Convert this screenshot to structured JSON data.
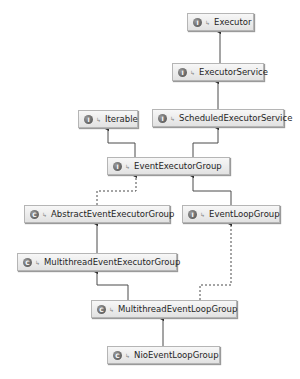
{
  "diagram": {
    "type": "class-hierarchy",
    "nodes": [
      {
        "id": "executor",
        "label": "Executor",
        "kind": "I",
        "x": 187,
        "y": 13,
        "w": 67
      },
      {
        "id": "executor-service",
        "label": "ExecutorService",
        "kind": "I",
        "x": 172,
        "y": 63,
        "w": 92
      },
      {
        "id": "iterable",
        "label": "Iterable",
        "kind": "I",
        "x": 78,
        "y": 110,
        "w": 60
      },
      {
        "id": "scheduled-executor-service",
        "label": "ScheduledExecutorService",
        "kind": "I",
        "x": 152,
        "y": 109,
        "w": 132
      },
      {
        "id": "event-executor-group",
        "label": "EventExecutorGroup",
        "kind": "I",
        "x": 107,
        "y": 157,
        "w": 123
      },
      {
        "id": "abstract-event-executor-group",
        "label": "AbstractEventExecutorGroup",
        "kind": "C",
        "x": 24,
        "y": 205,
        "w": 146
      },
      {
        "id": "event-loop-group",
        "label": "EventLoopGroup",
        "kind": "I",
        "x": 182,
        "y": 205,
        "w": 98
      },
      {
        "id": "multithread-event-executor-group",
        "label": "MultithreadEventExecutorGroup",
        "kind": "C",
        "x": 17,
        "y": 253,
        "w": 160
      },
      {
        "id": "multithread-event-loop-group",
        "label": "MultithreadEventLoopGroup",
        "kind": "C",
        "x": 91,
        "y": 300,
        "w": 146
      },
      {
        "id": "nio-event-loop-group",
        "label": "NioEventLoopGroup",
        "kind": "C",
        "x": 107,
        "y": 346,
        "w": 113
      }
    ],
    "edges": [
      {
        "from": "executor-service",
        "to": "executor",
        "style": "solid",
        "points": "220,63 220,31"
      },
      {
        "from": "scheduled-executor-service",
        "to": "executor-service",
        "style": "solid",
        "points": "218,109 218,81"
      },
      {
        "from": "event-executor-group",
        "to": "iterable",
        "style": "solid",
        "points": "135,157 135,143 108,143 108,128"
      },
      {
        "from": "event-executor-group",
        "to": "scheduled-executor-service",
        "style": "solid",
        "points": "193,157 193,143 218,143 218,127"
      },
      {
        "from": "abstract-event-executor-group",
        "to": "event-executor-group",
        "style": "dashed",
        "points": "97,205 97,191 136,191 136,175"
      },
      {
        "from": "event-loop-group",
        "to": "event-executor-group",
        "style": "solid",
        "points": "231,205 231,191 193,191 193,175"
      },
      {
        "from": "multithread-event-executor-group",
        "to": "abstract-event-executor-group",
        "style": "solid",
        "points": "97,253 97,223"
      },
      {
        "from": "multithread-event-loop-group",
        "to": "multithread-event-executor-group",
        "style": "solid",
        "points": "128,300 128,285 97,285 97,271"
      },
      {
        "from": "multithread-event-loop-group",
        "to": "event-loop-group",
        "style": "dashed",
        "points": "200,300 200,285 231,285 231,223"
      },
      {
        "from": "nio-event-loop-group",
        "to": "multithread-event-loop-group",
        "style": "solid",
        "points": "163,346 163,318"
      }
    ]
  },
  "icons": {
    "interface": "I",
    "class": "C",
    "visibility_glyph": "↳"
  },
  "colors": {
    "line": "#4a4a4a",
    "node_border": "#b5b5b5",
    "background": "#ffffff"
  }
}
